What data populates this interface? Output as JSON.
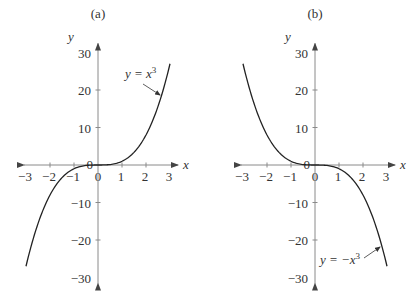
{
  "chart_data": [
    {
      "type": "line",
      "panel_label": "(a)",
      "title": "(a)",
      "xlabel": "x",
      "ylabel": "y",
      "xlim": [
        -3,
        3
      ],
      "ylim": [
        -30,
        30
      ],
      "x_ticks": [
        -3,
        -2,
        -1,
        0,
        1,
        2,
        3
      ],
      "x_tick_labels": [
        "−3",
        "−2",
        "−1",
        "0",
        "1",
        "2",
        "3"
      ],
      "y_ticks": [
        -30,
        -20,
        -10,
        0,
        10,
        20,
        30
      ],
      "y_tick_labels": [
        "−30",
        "−20",
        "−10",
        "0",
        "10",
        "20",
        "30"
      ],
      "grid": false,
      "series": [
        {
          "name": "y = x^3",
          "function": "x^3",
          "x": [
            -3,
            -2.5,
            -2,
            -1.5,
            -1,
            -0.5,
            0,
            0.5,
            1,
            1.5,
            2,
            2.5,
            3
          ],
          "values": [
            -27,
            -15.625,
            -8,
            -3.375,
            -1,
            -0.125,
            0,
            0.125,
            1,
            3.375,
            8,
            15.625,
            27
          ]
        }
      ],
      "annotation": {
        "text_prefix": "y = x",
        "superscript": "3"
      }
    },
    {
      "type": "line",
      "panel_label": "(b)",
      "title": "(b)",
      "xlabel": "x",
      "ylabel": "y",
      "xlim": [
        -3,
        3
      ],
      "ylim": [
        -30,
        30
      ],
      "x_ticks": [
        -3,
        -2,
        -1,
        0,
        1,
        2,
        3
      ],
      "x_tick_labels": [
        "−3",
        "−2",
        "−1",
        "0",
        "1",
        "2",
        "3"
      ],
      "y_ticks": [
        -30,
        -20,
        -10,
        0,
        10,
        20,
        30
      ],
      "y_tick_labels": [
        "−30",
        "−20",
        "−10",
        "0",
        "10",
        "20",
        "30"
      ],
      "grid": false,
      "series": [
        {
          "name": "y = -x^3",
          "function": "-x^3",
          "x": [
            -3,
            -2.5,
            -2,
            -1.5,
            -1,
            -0.5,
            0,
            0.5,
            1,
            1.5,
            2,
            2.5,
            3
          ],
          "values": [
            27,
            15.625,
            8,
            3.375,
            1,
            0.125,
            0,
            -0.125,
            -1,
            -3.375,
            -8,
            -15.625,
            -27
          ]
        }
      ],
      "annotation": {
        "text_prefix": "y = −x",
        "superscript": "3"
      }
    }
  ]
}
